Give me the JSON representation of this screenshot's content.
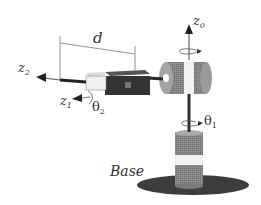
{
  "diagram": {
    "type": "robot-manipulator",
    "labels": {
      "z0": {
        "main": "z",
        "sub": "0"
      },
      "z1": {
        "main": "z",
        "sub": "1"
      },
      "z2": {
        "main": "z",
        "sub": "2"
      },
      "theta1": {
        "main": "θ",
        "sub": "1"
      },
      "theta2": {
        "main": "θ",
        "sub": "2"
      },
      "d": "d",
      "base": "Base"
    },
    "colors": {
      "dark": "#3a3a3a",
      "mid_gray": "#8a8a8a",
      "light_gray": "#bdbdbd",
      "white": "#f4f4f4",
      "line": "#555555"
    }
  }
}
